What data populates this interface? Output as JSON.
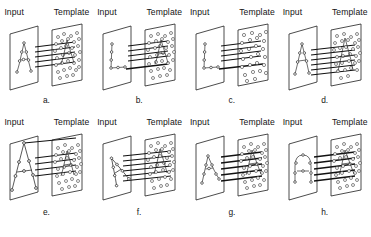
{
  "figure": {
    "columns": 4,
    "rows": 2,
    "plane_labels": {
      "input": "Input",
      "template": "Template"
    },
    "bottom_caption": ""
  },
  "panels": [
    {
      "id": "a",
      "caption": "a.",
      "input_label": "Input",
      "template_label": "Template",
      "input_shape": "letter-A",
      "input_shape_scale": "small",
      "input_shape_rotation": 0,
      "template_shape": "cluttered-point-cloud-with-A",
      "correspondence_lines": 5
    },
    {
      "id": "b",
      "caption": "b.",
      "input_label": "Input",
      "template_label": "Template",
      "input_shape": "letter-L",
      "input_shape_scale": "small",
      "input_shape_rotation": 0,
      "template_shape": "cluttered-point-cloud-with-A",
      "correspondence_lines": 5
    },
    {
      "id": "c",
      "caption": "c.",
      "input_label": "Input",
      "template_label": "Template",
      "input_shape": "letter-L",
      "input_shape_scale": "small",
      "input_shape_rotation": 0,
      "template_shape": "cluttered-point-cloud-sparse",
      "correspondence_lines": 5
    },
    {
      "id": "d",
      "caption": "d.",
      "input_label": "Input",
      "template_label": "Template",
      "input_shape": "letter-A",
      "input_shape_scale": "small",
      "input_shape_rotation": 0,
      "template_shape": "cluttered-point-cloud-with-A",
      "correspondence_lines": 6
    },
    {
      "id": "e",
      "caption": "e.",
      "input_label": "Input",
      "template_label": "Template",
      "input_shape": "letter-A",
      "input_shape_scale": "large-overflowing",
      "input_shape_rotation": 0,
      "template_shape": "cluttered-point-cloud-with-A",
      "correspondence_lines": 5
    },
    {
      "id": "f",
      "caption": "f.",
      "input_label": "Input",
      "template_label": "Template",
      "input_shape": "letter-A",
      "input_shape_scale": "small-rotated",
      "input_shape_rotation": -25,
      "template_shape": "cluttered-point-cloud-with-A",
      "correspondence_lines": 6
    },
    {
      "id": "g",
      "caption": "g.",
      "input_label": "Input",
      "template_label": "Template",
      "input_shape": "letter-A-sheared",
      "input_shape_scale": "small",
      "input_shape_rotation": -12,
      "template_shape": "cluttered-point-cloud-with-A",
      "correspondence_lines": 5
    },
    {
      "id": "h",
      "caption": "h.",
      "input_label": "Input",
      "template_label": "Template",
      "input_shape": "arch-no-crossbar",
      "input_shape_scale": "small",
      "input_shape_rotation": 0,
      "template_shape": "cluttered-point-cloud-with-A",
      "correspondence_lines": 5
    }
  ],
  "colors": {
    "plane_stroke": "#1e1e1e",
    "point_stroke": "#3a3a3a",
    "point_fill": "#ffffff",
    "line": "#111111",
    "text": "#141414",
    "background": "#ffffff"
  }
}
